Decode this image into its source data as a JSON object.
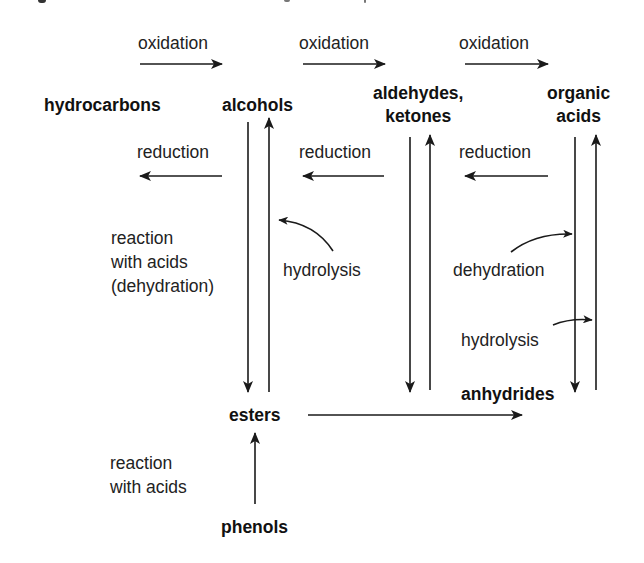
{
  "diagram": {
    "type": "reaction-pathway",
    "nodes": {
      "hydrocarbons": "hydrocarbons",
      "alcohols": "alcohols",
      "aldehydes_ketones": "aldehydes,\nketones",
      "organic_acids": "organic\nacids",
      "esters": "esters",
      "anhydrides": "anhydrides",
      "phenols": "phenols"
    },
    "labels": {
      "oxidation_1": "oxidation",
      "oxidation_2": "oxidation",
      "oxidation_3": "oxidation",
      "reduction_1": "reduction",
      "reduction_2": "reduction",
      "reduction_3": "reduction",
      "reaction_with_acids_dehydration": "reaction\nwith acids\n(dehydration)",
      "hydrolysis_esters": "hydrolysis",
      "dehydration": "dehydration",
      "hydrolysis_anhydrides": "hydrolysis",
      "reaction_with_acids": "reaction\nwith acids"
    },
    "edges": [
      {
        "from": "hydrocarbons",
        "to": "alcohols",
        "label": "oxidation"
      },
      {
        "from": "alcohols",
        "to": "aldehydes, ketones",
        "label": "oxidation"
      },
      {
        "from": "aldehydes, ketones",
        "to": "organic acids",
        "label": "oxidation"
      },
      {
        "from": "alcohols",
        "to": "hydrocarbons",
        "label": "reduction"
      },
      {
        "from": "aldehydes, ketones",
        "to": "alcohols",
        "label": "reduction"
      },
      {
        "from": "organic acids",
        "to": "aldehydes, ketones",
        "label": "reduction"
      },
      {
        "from": "alcohols",
        "to": "esters",
        "label": "reaction with acids (dehydration)"
      },
      {
        "from": "esters",
        "to": "alcohols",
        "label": "hydrolysis"
      },
      {
        "from": "aldehydes, ketones",
        "to": "esters-level",
        "label": ""
      },
      {
        "from": "esters-level",
        "to": "aldehydes, ketones",
        "label": ""
      },
      {
        "from": "organic acids",
        "to": "anhydrides",
        "label": "dehydration"
      },
      {
        "from": "anhydrides",
        "to": "organic acids",
        "label": "hydrolysis"
      },
      {
        "from": "esters",
        "to": "anhydrides",
        "label": ""
      },
      {
        "from": "phenols",
        "to": "esters",
        "label": "reaction with acids"
      }
    ],
    "colors": {
      "ink": "#1a1a1a",
      "background": "#ffffff"
    }
  }
}
